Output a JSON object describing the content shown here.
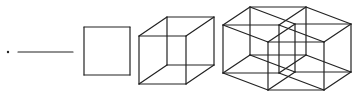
{
  "diagram": {
    "stroke_color": "#222222",
    "background": "#ffffff",
    "figures": [
      {
        "name": "point",
        "dimension": 0,
        "center": [
          8,
          52
        ]
      },
      {
        "name": "line",
        "dimension": 1,
        "from": [
          18,
          52
        ],
        "to": [
          73,
          52
        ]
      },
      {
        "name": "square",
        "dimension": 2,
        "x": 84,
        "y": 27,
        "w": 46,
        "h": 48
      },
      {
        "name": "cube",
        "dimension": 3,
        "origin": [
          139,
          36
        ],
        "u": [
          47,
          0
        ],
        "v": [
          0,
          48
        ],
        "w": [
          28,
          -19
        ]
      },
      {
        "name": "tesseract",
        "dimension": 4,
        "origin": [
          223,
          25
        ],
        "u": [
          45,
          17
        ],
        "v": [
          0,
          48
        ],
        "w": [
          27,
          -18
        ],
        "t": [
          56,
          0
        ]
      }
    ]
  }
}
